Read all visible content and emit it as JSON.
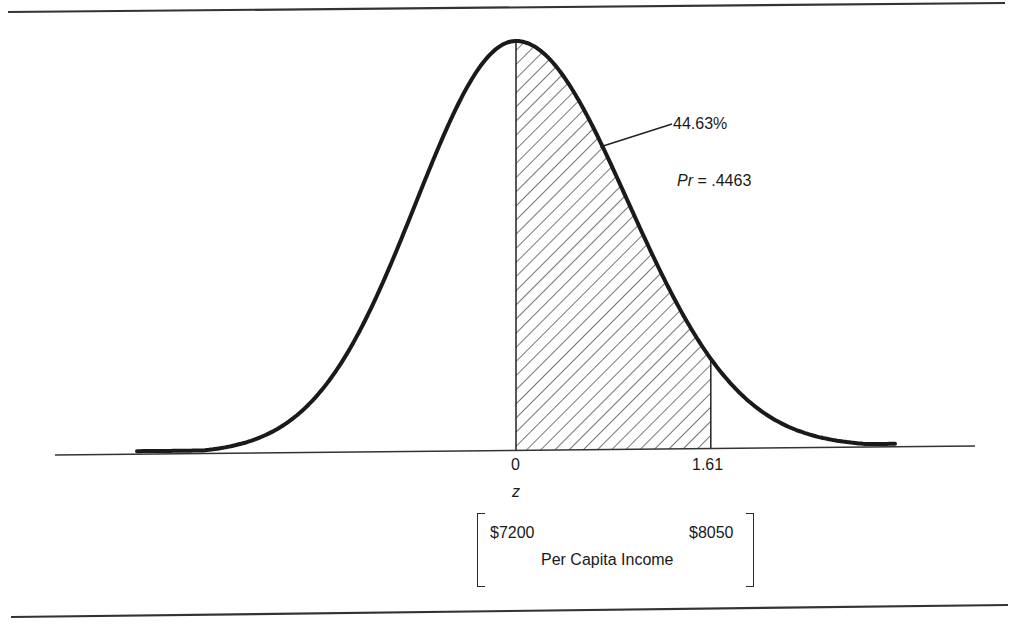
{
  "chart_data": {
    "type": "area",
    "title": "",
    "xlabel": "z",
    "secondary_xlabel": "Per Capita Income",
    "ticks": [
      {
        "z": 0,
        "label": "0",
        "income": "$7200"
      },
      {
        "z": 1.61,
        "label": "1.61",
        "income": "$8050"
      }
    ],
    "shaded_region": {
      "from_z": 0,
      "to_z": 1.61,
      "pattern": "diagonal-hatch"
    },
    "annotations": {
      "area_percent": "44.63%",
      "probability": "Pr = .4463",
      "probability_value": 0.4463
    },
    "xlim_z": [
      -3.5,
      3.5
    ],
    "grid": false,
    "legend": null
  },
  "labels": {
    "tick_zero": "0",
    "tick_z": "1.61",
    "axis_z": "z",
    "income_low": "$7200",
    "income_high": "$8050",
    "income_title": "Per Capita Income",
    "area_percent": "44.63%",
    "pr_prefix": "Pr",
    "pr_rest": " = .4463"
  },
  "colors": {
    "ink": "#1a1a1a",
    "background": "#ffffff"
  }
}
